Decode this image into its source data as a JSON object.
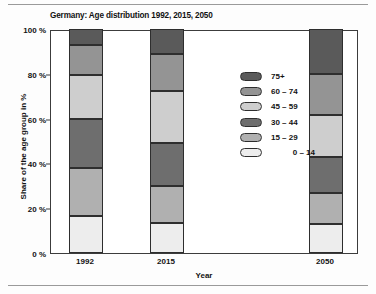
{
  "chart_data": {
    "type": "bar",
    "subtype": "stacked-100-percent",
    "title": "Germany: Age distribution 1992, 2015, 2050",
    "xlabel": "Year",
    "ylabel": "Share of the age group in %",
    "categories": [
      "1992",
      "2015",
      "2050"
    ],
    "ylim": [
      0,
      100
    ],
    "ytick_labels": [
      "0 %",
      "20 %",
      "40 %",
      "60 %",
      "80 %",
      "100 %"
    ],
    "ytick_values": [
      0,
      20,
      40,
      60,
      80,
      100
    ],
    "grid": false,
    "legend_position": "inside-center",
    "series": [
      {
        "name": "0 – 14",
        "color": "#ededed",
        "values": [
          16.5,
          13.5,
          13.0
        ]
      },
      {
        "name": "15 – 29",
        "color": "#b0b0b0",
        "values": [
          21.5,
          16.5,
          14.0
        ]
      },
      {
        "name": "30 – 44",
        "color": "#6e6e6e",
        "values": [
          22.0,
          19.0,
          16.0
        ]
      },
      {
        "name": "45 – 59",
        "color": "#cecece",
        "values": [
          19.5,
          23.5,
          18.5
        ]
      },
      {
        "name": "60 – 74",
        "color": "#949494",
        "values": [
          13.5,
          16.5,
          18.5
        ]
      },
      {
        "name": "75+",
        "color": "#5a5a5a",
        "values": [
          7.0,
          11.0,
          20.0
        ]
      }
    ],
    "legend_order": [
      "75+",
      "60 – 74",
      "45 – 59",
      "30 – 44",
      "15 – 29",
      "0 – 14"
    ],
    "colors": {
      "age_75_plus": "#5a5a5a",
      "age_60_74": "#949494",
      "age_45_59": "#cecece",
      "age_30_44": "#6e6e6e",
      "age_15_29": "#b0b0b0",
      "age_0_14": "#ededed",
      "axis": "#3c3c3c",
      "segment_border": "#2e2e2e",
      "text": "#131313"
    }
  }
}
